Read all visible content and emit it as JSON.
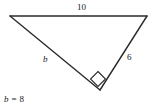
{
  "figure": {
    "type": "geometry-diagram",
    "background_color": "#ffffff",
    "stroke_color": "#2b2b2b",
    "text_color": "#1a1a1a"
  },
  "triangle": {
    "vertices": {
      "top_left": {
        "x": 10,
        "y": 16
      },
      "top_right": {
        "x": 147,
        "y": 16
      },
      "bottom": {
        "x": 100,
        "y": 90
      }
    },
    "right_angle": {
      "at_vertex": "bottom",
      "marker": "square",
      "center": {
        "x": 98,
        "y": 79
      },
      "size": 9
    }
  },
  "labels": {
    "top_side": "10",
    "left_side": "b",
    "right_side": "6"
  },
  "caption": {
    "variable": "b",
    "operator": "=",
    "value": "8",
    "full": "b = 8"
  }
}
